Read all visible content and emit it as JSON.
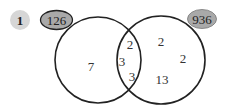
{
  "figure": {
    "index_label": "1",
    "colors": {
      "index_badge_fill": "#d6d6d6",
      "set_badge_fill": "#a9a9a9",
      "set_badge_stroke": "#222222",
      "circle_stroke": "#222222",
      "text": "#333333",
      "background": "#ffffff"
    },
    "sets": [
      {
        "name": "left",
        "total": "126"
      },
      {
        "name": "right",
        "total": "936"
      }
    ],
    "regions": {
      "left_only": [
        "7"
      ],
      "intersection": [
        "2",
        "3",
        "3"
      ],
      "right_only": [
        "2",
        "2",
        "13"
      ]
    }
  }
}
